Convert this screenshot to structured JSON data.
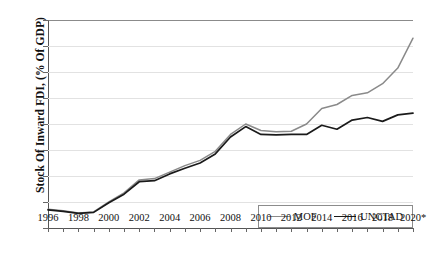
{
  "chart_data": {
    "type": "line",
    "title": "",
    "xlabel": "",
    "ylabel": "Stock Of Inward FDI, (% Of GDP)",
    "ylim": [
      0,
      8
    ],
    "xlim": [
      1996,
      2020
    ],
    "grid": true,
    "legend_position": "bottom-right-inside",
    "ytick_labels": [
      "0%",
      "1%",
      "2%",
      "3%",
      "4%",
      "5%",
      "6%",
      "7%",
      "8%"
    ],
    "ytick_values": [
      0,
      1,
      2,
      3,
      4,
      5,
      6,
      7,
      8
    ],
    "xtick_labels": [
      "1996",
      "1998",
      "2000",
      "2002",
      "2004",
      "2006",
      "2008",
      "2010",
      "2012",
      "2014",
      "2016",
      "2018",
      "2020*"
    ],
    "xtick_values": [
      1996,
      1998,
      2000,
      2002,
      2004,
      2006,
      2008,
      2010,
      2012,
      2014,
      2016,
      2018,
      2020
    ],
    "x": [
      1996,
      1997,
      1998,
      1999,
      2000,
      2001,
      2002,
      2003,
      2004,
      2005,
      2006,
      2007,
      2008,
      2009,
      2010,
      2011,
      2012,
      2013,
      2014,
      2015,
      2016,
      2017,
      2018,
      2019,
      2020
    ],
    "series": [
      {
        "name": "MOF",
        "color": "#8a8a8a",
        "values": [
          0.72,
          0.66,
          0.58,
          0.62,
          1.0,
          1.35,
          1.85,
          1.9,
          2.15,
          2.4,
          2.6,
          2.95,
          3.6,
          4.0,
          3.75,
          3.7,
          3.72,
          4.0,
          4.6,
          4.75,
          5.1,
          5.2,
          5.55,
          6.15,
          7.3
        ]
      },
      {
        "name": "UNCTAD",
        "color": "#1a1a1a",
        "values": [
          0.7,
          0.64,
          0.56,
          0.6,
          0.97,
          1.3,
          1.78,
          1.82,
          2.08,
          2.3,
          2.5,
          2.85,
          3.5,
          3.9,
          3.6,
          3.58,
          3.6,
          3.6,
          3.95,
          3.8,
          4.15,
          4.25,
          4.1,
          4.35,
          4.42
        ]
      }
    ]
  },
  "legend": {
    "entries": [
      {
        "label": "MOF",
        "color": "#8a8a8a"
      },
      {
        "label": "UNCTAD",
        "color": "#1a1a1a"
      }
    ]
  }
}
